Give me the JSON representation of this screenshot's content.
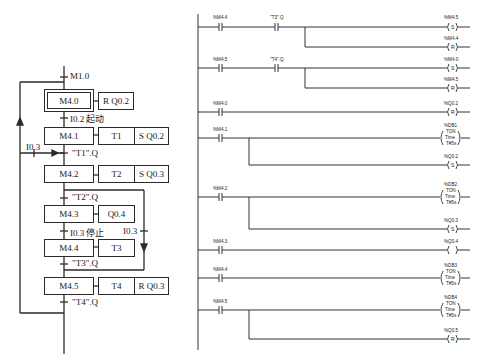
{
  "sfc": {
    "initial_transition": "M1.0",
    "steps": [
      {
        "id": "M4.0",
        "initial": true,
        "actions": [
          "R  Q0.2"
        ]
      },
      {
        "id": "M4.1",
        "actions": [
          "T1",
          "S  Q0.2"
        ]
      },
      {
        "id": "M4.2",
        "actions": [
          "T2",
          "S  Q0.3"
        ]
      },
      {
        "id": "M4.3",
        "actions": [
          "Q0.4"
        ]
      },
      {
        "id": "M4.4",
        "actions": [
          "T3"
        ]
      },
      {
        "id": "M4.5",
        "actions": [
          "T4",
          "R  Q0.3"
        ]
      }
    ],
    "transitions": {
      "t0": "I0.2  起动",
      "t1": "\"T1\".Q",
      "t2": "\"T2\".Q",
      "t3": "I0.3  停止",
      "t4": "\"T3\".Q",
      "t5": "\"T4\".Q",
      "branch_left": "I0.3",
      "branch_right": "I0.3"
    }
  },
  "ladder": {
    "rungs": [
      {
        "contacts": [
          "%M4.4",
          "\"T3\".Q"
        ],
        "coils": [
          {
            "addr": "%M4.5",
            "type": "S"
          },
          {
            "addr": "%M4.4",
            "type": "R"
          }
        ]
      },
      {
        "contacts": [
          "%M4.5",
          "\"T4\".Q"
        ],
        "coils": [
          {
            "addr": "%M4.0",
            "type": "S"
          },
          {
            "addr": "%M4.5",
            "type": "R"
          }
        ]
      },
      {
        "contacts": [
          "%M4.0"
        ],
        "coils": [
          {
            "addr": "%Q0.2",
            "type": "R"
          }
        ]
      },
      {
        "contacts": [
          "%M4.1"
        ],
        "coils": [
          {
            "addr": "%DB1",
            "type": "TON",
            "sub": "Time",
            "val": "T#5s"
          },
          {
            "addr": "%Q0.2",
            "type": "S"
          }
        ]
      },
      {
        "contacts": [
          "%M4.2"
        ],
        "coils": [
          {
            "addr": "%DB2",
            "type": "TON",
            "sub": "Time",
            "val": "T#5s"
          },
          {
            "addr": "%Q0.3",
            "type": "S"
          }
        ]
      },
      {
        "contacts": [
          "%M4.3"
        ],
        "coils": [
          {
            "addr": "%Q0.4",
            "type": ""
          }
        ]
      },
      {
        "contacts": [
          "%M4.4"
        ],
        "coils": [
          {
            "addr": "%DB3",
            "type": "TON",
            "sub": "Time",
            "val": "T#5s"
          }
        ]
      },
      {
        "contacts": [
          "%M4.5"
        ],
        "coils": [
          {
            "addr": "%DB4",
            "type": "TON",
            "sub": "Time",
            "val": "T#5s"
          },
          {
            "addr": "%Q0.5",
            "type": "R"
          }
        ]
      }
    ]
  }
}
